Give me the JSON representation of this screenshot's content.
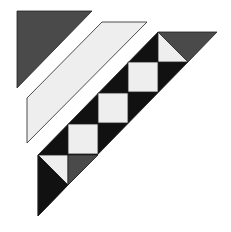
{
  "diagram": {
    "colors": {
      "background": "#ffffff",
      "dark_gray": "#4a4a4a",
      "black": "#111111",
      "light": "#eeeeee",
      "outline": "#222222"
    },
    "pieces": [
      {
        "id": "corner-triangle",
        "fill": "dark_gray",
        "points": "17,11 92,11 17,88"
      },
      {
        "id": "border-strip",
        "fill": "light",
        "points": "102,22 147,22 27,143 27,98"
      },
      {
        "id": "strip-black-background",
        "fill": "black",
        "points": "158,32 188,62 68,185 38,216 38,155"
      },
      {
        "id": "top-dark-triangle",
        "fill": "dark_gray",
        "points": "158,32 217,32 188,62"
      },
      {
        "id": "top-light-triangle",
        "fill": "light",
        "points": "158,32 158,62 188,62"
      },
      {
        "id": "square-1",
        "fill": "light",
        "points": "128,62 158,62 158,92 128,92"
      },
      {
        "id": "square-2",
        "fill": "light",
        "points": "98,93 128,93 128,123 98,123"
      },
      {
        "id": "square-3",
        "fill": "light",
        "points": "68,124 98,124 98,154 68,154"
      },
      {
        "id": "bottom-light-triangle",
        "fill": "light",
        "points": "38,155 68,155 68,185"
      },
      {
        "id": "bottom-dark-triangle",
        "fill": "dark_gray",
        "points": "68,155 98,155 68,185"
      },
      {
        "id": "bottom-black-triangle",
        "fill": "black",
        "points": "38,155 68,185 38,216"
      }
    ]
  }
}
